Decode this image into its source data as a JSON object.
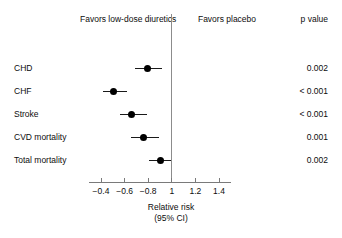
{
  "header": {
    "favors_left": "Favors low-dose diuretics",
    "favors_right": "Favors placebo",
    "p_column": "p value"
  },
  "axis": {
    "title_line1": "Relative risk",
    "title_line2": "(95% CI)",
    "tick_labels": [
      "−0.4",
      "−0.6",
      "−0.8",
      "1",
      "1.2",
      "1.4"
    ],
    "reference_value": "1"
  },
  "chart_data": {
    "type": "scatter",
    "title": "",
    "subtitle": "",
    "xlabel": "Relative risk (95% CI)",
    "ylabel": "",
    "xlim": [
      0.3,
      1.5
    ],
    "grid": false,
    "legend": "none",
    "reference_line": 1.0,
    "xticks": [
      0.4,
      0.6,
      0.8,
      1.0,
      1.2,
      1.4
    ],
    "xticklabels": [
      "−0.4",
      "−0.6",
      "−0.8",
      "1",
      "1.2",
      "1.4"
    ],
    "categories": [
      "CHD",
      "CHF",
      "Stroke",
      "CVD mortality",
      "Total mortality"
    ],
    "series": [
      {
        "name": "Relative risk",
        "values": [
          0.79,
          0.51,
          0.66,
          0.76,
          0.9
        ],
        "ci_low": [
          0.69,
          0.42,
          0.56,
          0.65,
          0.81
        ],
        "ci_high": [
          0.92,
          0.62,
          0.79,
          0.89,
          0.99
        ]
      }
    ],
    "p_values": [
      "0.002",
      "< 0.001",
      "< 0.001",
      "0.001",
      "0.002"
    ],
    "annotations": {
      "left_side": "Favors low-dose diuretics",
      "right_side": "Favors placebo",
      "p_column_header": "p value"
    }
  },
  "rows": [
    {
      "label": "CHD",
      "p": "0.002"
    },
    {
      "label": "CHF",
      "p": "< 0.001"
    },
    {
      "label": "Stroke",
      "p": "< 0.001"
    },
    {
      "label": "CVD mortality",
      "p": "0.001"
    },
    {
      "label": "Total mortality",
      "p": "0.002"
    }
  ],
  "colors": {
    "marker": "#000000",
    "ci_line": "#1a1a1a",
    "axis": "#7a7a7a",
    "reference_line": "#8c8c8c",
    "text": "#0d0d0d",
    "background": "#ffffff"
  }
}
